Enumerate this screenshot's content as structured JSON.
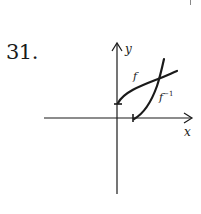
{
  "problem": {
    "number": "31."
  },
  "graph": {
    "x_axis_label": "x",
    "y_axis_label": "y",
    "curves": [
      {
        "name": "f",
        "label": "f",
        "description": "increasing concave-down curve starting on positive y-axis"
      },
      {
        "name": "f_inverse",
        "label": "f",
        "label_superscript": "−1",
        "description": "reflection of f across y=x, starting on positive x-axis"
      }
    ],
    "intersection": "curves cross on line y = x",
    "colors": {
      "ink": "#1a1a1a"
    }
  }
}
